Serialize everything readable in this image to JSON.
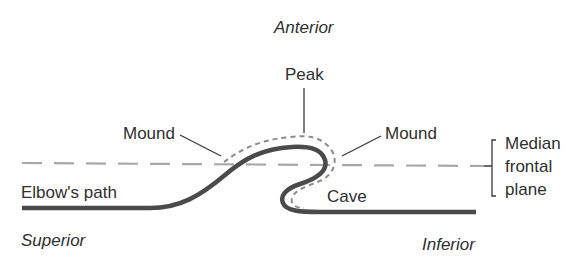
{
  "diagram": {
    "orientation": {
      "top": "Anterior",
      "bottom_left": "Superior",
      "bottom_right": "Inferior"
    },
    "labels": {
      "peak": "Peak",
      "mound_left": "Mound",
      "mound_right": "Mound",
      "cave": "Cave",
      "path": "Elbow's path"
    },
    "plane": {
      "line1": "Median",
      "line2": "frontal",
      "line3": "plane"
    },
    "colors": {
      "path_stroke": "#4a4a4a",
      "dotted_outline": "#8c8c8c",
      "plane_dash": "#a8a8a8",
      "leader_line": "#3a3a3a",
      "text": "#2f2f2f"
    }
  }
}
